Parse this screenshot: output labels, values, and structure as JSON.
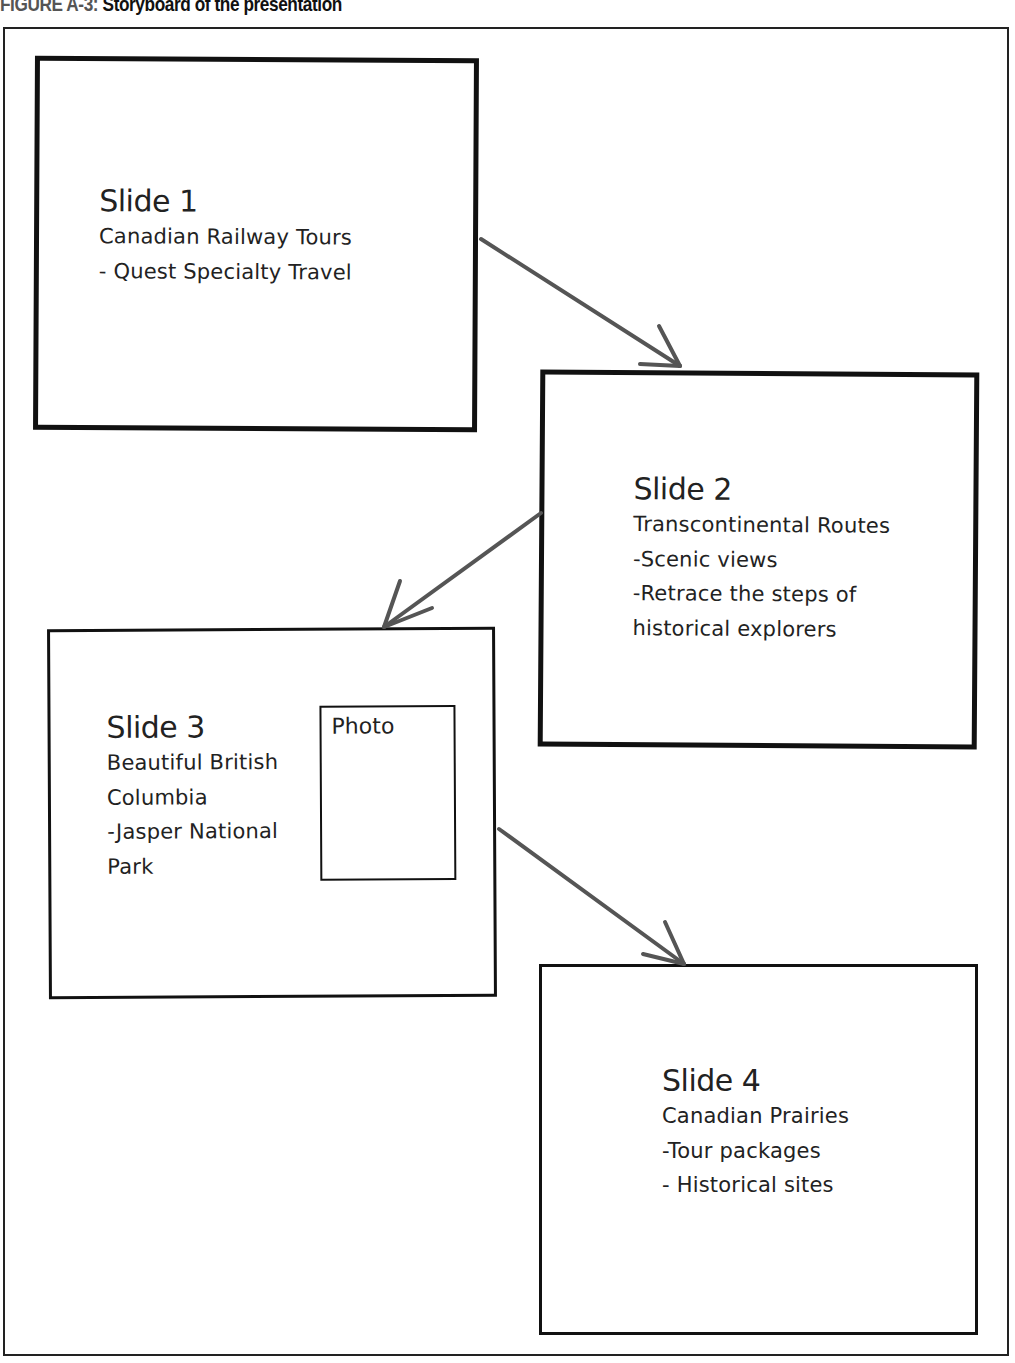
{
  "caption": {
    "figure_label": "FIGURE A-3:",
    "title": " Storyboard of the presentation"
  },
  "slides": [
    {
      "title": "Slide 1",
      "lines": [
        "Canadian Railway Tours",
        "- Quest Specialty Travel"
      ]
    },
    {
      "title": "Slide 2",
      "lines": [
        "Transcontinental Routes",
        "-Scenic views",
        "-Retrace the steps of",
        "historical explorers"
      ]
    },
    {
      "title": "Slide 3",
      "lines": [
        "Beautiful British",
        "Columbia",
        "-Jasper National",
        "Park"
      ],
      "photo_label": "Photo"
    },
    {
      "title": "Slide 4",
      "lines": [
        "Canadian Prairies",
        "-Tour packages",
        "- Historical sites"
      ]
    }
  ],
  "connections": [
    {
      "from": "Slide 1",
      "to": "Slide 2"
    },
    {
      "from": "Slide 2",
      "to": "Slide 3"
    },
    {
      "from": "Slide 3",
      "to": "Slide 4"
    }
  ],
  "colors": {
    "box_border": "#111111",
    "arrow": "#555555",
    "caption_label": "#555555"
  }
}
